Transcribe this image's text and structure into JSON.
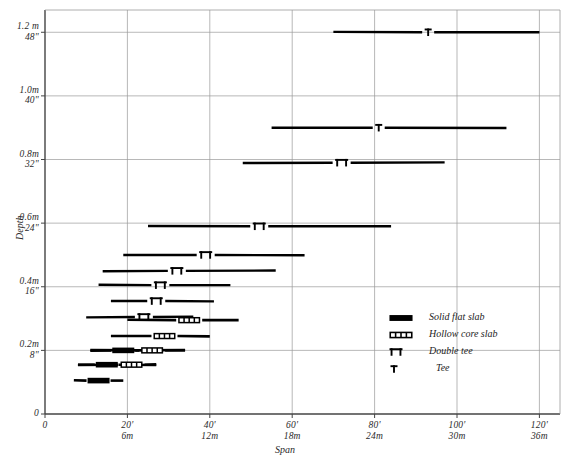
{
  "chart_data": {
    "type": "range-bar",
    "title": "",
    "xlabel": "Span",
    "ylabel": "Depth",
    "xlim": [
      0,
      125
    ],
    "ylim": [
      0,
      1.27
    ],
    "grid": true,
    "x_unit_primary": "feet",
    "x_unit_secondary": "metres",
    "y_unit_primary": "metres",
    "y_unit_secondary": "inches",
    "x_ticks": [
      {
        "value": 0,
        "label_primary": "0",
        "label_secondary": ""
      },
      {
        "value": 20,
        "label_primary": "20'",
        "label_secondary": "6m"
      },
      {
        "value": 40,
        "label_primary": "40'",
        "label_secondary": "12m"
      },
      {
        "value": 60,
        "label_primary": "60'",
        "label_secondary": "18m"
      },
      {
        "value": 80,
        "label_primary": "80'",
        "label_secondary": "24m"
      },
      {
        "value": 100,
        "label_primary": "100'",
        "label_secondary": "30m"
      },
      {
        "value": 120,
        "label_primary": "120'",
        "label_secondary": "36m"
      }
    ],
    "y_ticks": [
      {
        "value": 0.0,
        "label_primary": "0",
        "label_secondary": ""
      },
      {
        "value": 0.2,
        "label_primary": "0.2m",
        "label_secondary": "8\""
      },
      {
        "value": 0.4,
        "label_primary": "0.4m",
        "label_secondary": "16\""
      },
      {
        "value": 0.6,
        "label_primary": "0.6m",
        "label_secondary": "24\""
      },
      {
        "value": 0.8,
        "label_primary": "0.8m",
        "label_secondary": "32\""
      },
      {
        "value": 1.0,
        "label_primary": "1.0m",
        "label_secondary": "40\""
      },
      {
        "value": 1.2,
        "label_primary": "1.2 m",
        "label_secondary": "48\""
      }
    ],
    "legend": {
      "position": "inside-right",
      "entries": [
        {
          "symbol": "solid-flat-slab",
          "label": "Solid flat slab"
        },
        {
          "symbol": "hollow-core-slab",
          "label": "Hollow core slab"
        },
        {
          "symbol": "double-tee",
          "label": "Double tee"
        },
        {
          "symbol": "tee",
          "label": "Tee"
        }
      ]
    },
    "series": [
      {
        "name": "Tee",
        "symbol": "tee",
        "depth_m": 1.2,
        "span_start_ft": 70,
        "span_end_ft": 120,
        "marker_ft": 93
      },
      {
        "name": "Tee",
        "symbol": "tee",
        "depth_m": 0.9,
        "span_start_ft": 55,
        "span_end_ft": 112,
        "marker_ft": 81
      },
      {
        "name": "Double tee",
        "symbol": "double-tee",
        "depth_m": 0.79,
        "span_start_ft": 48,
        "span_end_ft": 97,
        "marker_ft": 72
      },
      {
        "name": "Double tee",
        "symbol": "double-tee",
        "depth_m": 0.59,
        "span_start_ft": 25,
        "span_end_ft": 84,
        "marker_ft": 52
      },
      {
        "name": "Double tee",
        "symbol": "double-tee",
        "depth_m": 0.5,
        "span_start_ft": 19,
        "span_end_ft": 63,
        "marker_ft": 39
      },
      {
        "name": "Double tee",
        "symbol": "double-tee",
        "depth_m": 0.45,
        "span_start_ft": 14,
        "span_end_ft": 56,
        "marker_ft": 32
      },
      {
        "name": "Double tee",
        "symbol": "double-tee",
        "depth_m": 0.405,
        "span_start_ft": 13,
        "span_end_ft": 45,
        "marker_ft": 28
      },
      {
        "name": "Double tee",
        "symbol": "double-tee",
        "depth_m": 0.355,
        "span_start_ft": 16,
        "span_end_ft": 41,
        "marker_ft": 27
      },
      {
        "name": "Double tee",
        "symbol": "double-tee",
        "depth_m": 0.305,
        "span_start_ft": 10,
        "span_end_ft": 36,
        "marker_ft": 24
      },
      {
        "name": "Hollow core slab",
        "symbol": "hollow-core-slab",
        "depth_m": 0.295,
        "span_start_ft": 20,
        "span_end_ft": 47,
        "marker_ft": 35
      },
      {
        "name": "Hollow core slab",
        "symbol": "hollow-core-slab",
        "depth_m": 0.245,
        "span_start_ft": 16,
        "span_end_ft": 40,
        "marker_ft": 29
      },
      {
        "name": "Solid flat slab",
        "symbol": "solid-flat-slab",
        "depth_m": 0.2,
        "span_start_ft": 11,
        "span_end_ft": 34,
        "marker_ft": 19
      },
      {
        "name": "Hollow core slab",
        "symbol": "hollow-core-slab",
        "depth_m": 0.2,
        "span_start_ft": 11,
        "span_end_ft": 34,
        "marker_ft": 26
      },
      {
        "name": "Solid flat slab",
        "symbol": "solid-flat-slab",
        "depth_m": 0.155,
        "span_start_ft": 8,
        "span_end_ft": 27,
        "marker_ft": 15
      },
      {
        "name": "Hollow core slab",
        "symbol": "hollow-core-slab",
        "depth_m": 0.155,
        "span_start_ft": 8,
        "span_end_ft": 27,
        "marker_ft": 21
      },
      {
        "name": "Solid flat slab",
        "symbol": "solid-flat-slab",
        "depth_m": 0.105,
        "span_start_ft": 7,
        "span_end_ft": 19,
        "marker_ft": 13
      }
    ],
    "colors": {
      "ink": "#000000",
      "grid": "#9a9a9a",
      "axis": "#444444",
      "background": "#ffffff"
    }
  }
}
